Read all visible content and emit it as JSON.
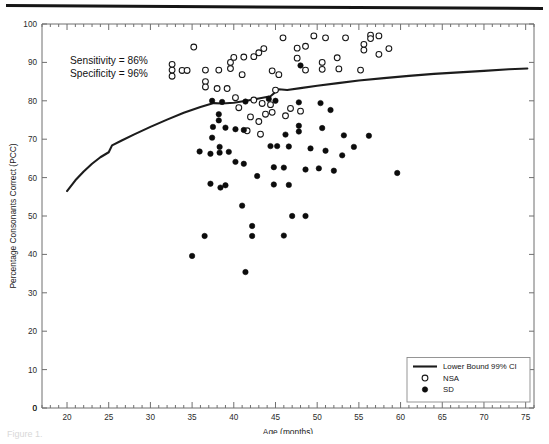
{
  "figure": {
    "caption_fragment": "Figure 1."
  },
  "annotations": [
    "Sensitivity = 86%",
    "Specificity = 96%"
  ],
  "legend": {
    "title": "",
    "items": [
      {
        "label": "Lower Bound 99% CI",
        "marker": "line"
      },
      {
        "label": "NSA",
        "marker": "open-circle"
      },
      {
        "label": "SD",
        "marker": "filled-circle"
      }
    ]
  },
  "chart_data": {
    "type": "scatter",
    "title": "",
    "xlabel": "Age (months)",
    "ylabel": "Percentage Consonants Correct (PCC)",
    "xlim": [
      17,
      76
    ],
    "ylim": [
      0,
      100
    ],
    "xticks": [
      20,
      25,
      30,
      35,
      40,
      45,
      50,
      55,
      60,
      65,
      70,
      75
    ],
    "xminor_step": 1,
    "yticks": [
      0,
      10,
      20,
      30,
      40,
      50,
      60,
      70,
      80,
      90,
      100
    ],
    "origin_label": "0",
    "grid": false,
    "legend_position": "lower-right",
    "series": [
      {
        "name": "Lower Bound 99% CI",
        "type": "line",
        "color": "#1c1c1c",
        "points": [
          [
            20.0,
            56.5
          ],
          [
            21.0,
            59.3
          ],
          [
            22.0,
            61.6
          ],
          [
            23.0,
            63.6
          ],
          [
            24.0,
            65.3
          ],
          [
            25.0,
            66.6
          ],
          [
            25.4,
            68.4
          ],
          [
            26.5,
            69.6
          ],
          [
            28.0,
            71.2
          ],
          [
            30.0,
            73.2
          ],
          [
            32.0,
            75.1
          ],
          [
            34.0,
            76.9
          ],
          [
            36.0,
            78.4
          ],
          [
            37.6,
            79.4
          ],
          [
            38.6,
            79.3
          ],
          [
            40.0,
            79.5
          ],
          [
            41.5,
            80.0
          ],
          [
            43.0,
            80.6
          ],
          [
            44.4,
            81.2
          ],
          [
            45.4,
            83.0
          ],
          [
            46.4,
            82.8
          ],
          [
            48.0,
            83.3
          ],
          [
            50.0,
            83.9
          ],
          [
            52.5,
            84.6
          ],
          [
            55.0,
            85.3
          ],
          [
            58.0,
            85.9
          ],
          [
            61.0,
            86.5
          ],
          [
            64.0,
            87.0
          ],
          [
            67.0,
            87.4
          ],
          [
            70.0,
            87.8
          ],
          [
            73.0,
            88.2
          ],
          [
            75.2,
            88.4
          ]
        ]
      },
      {
        "name": "NSA",
        "type": "scatter",
        "marker": "open-circle",
        "points": [
          [
            35.2,
            94.0
          ],
          [
            32.6,
            89.5
          ],
          [
            32.6,
            88.0
          ],
          [
            32.6,
            86.4
          ],
          [
            33.8,
            87.9
          ],
          [
            34.4,
            87.9
          ],
          [
            36.6,
            88.0
          ],
          [
            38.2,
            88.0
          ],
          [
            36.6,
            85.0
          ],
          [
            36.6,
            83.6
          ],
          [
            38.0,
            83.2
          ],
          [
            39.2,
            83.2
          ],
          [
            39.6,
            88.4
          ],
          [
            39.6,
            90.0
          ],
          [
            40.0,
            91.3
          ],
          [
            41.2,
            91.4
          ],
          [
            42.4,
            91.5
          ],
          [
            43.0,
            92.5
          ],
          [
            43.6,
            93.6
          ],
          [
            44.6,
            87.8
          ],
          [
            45.4,
            86.8
          ],
          [
            41.0,
            86.8
          ],
          [
            40.2,
            80.8
          ],
          [
            40.6,
            78.2
          ],
          [
            42.4,
            80.2
          ],
          [
            43.4,
            79.3
          ],
          [
            44.4,
            79.0
          ],
          [
            42.0,
            75.8
          ],
          [
            43.0,
            74.6
          ],
          [
            41.6,
            72.2
          ],
          [
            43.2,
            71.3
          ],
          [
            45.0,
            82.8
          ],
          [
            45.9,
            96.4
          ],
          [
            47.6,
            93.7
          ],
          [
            47.6,
            91.1
          ],
          [
            48.6,
            94.2
          ],
          [
            48.6,
            88.0
          ],
          [
            49.6,
            96.9
          ],
          [
            51.0,
            96.4
          ],
          [
            50.6,
            90.0
          ],
          [
            50.6,
            88.2
          ],
          [
            52.4,
            91.2
          ],
          [
            52.6,
            88.3
          ],
          [
            53.4,
            96.4
          ],
          [
            55.6,
            94.7
          ],
          [
            55.6,
            93.2
          ],
          [
            56.4,
            97.1
          ],
          [
            56.4,
            96.2
          ],
          [
            57.4,
            96.9
          ],
          [
            57.4,
            92.1
          ],
          [
            55.2,
            88.0
          ],
          [
            58.6,
            93.6
          ],
          [
            46.8,
            78.0
          ],
          [
            48.0,
            77.3
          ],
          [
            46.2,
            76.1
          ],
          [
            44.6,
            77.0
          ],
          [
            43.8,
            76.5
          ]
        ]
      },
      {
        "name": "SD",
        "type": "scatter",
        "marker": "filled-circle",
        "points": [
          [
            48.0,
            89.2
          ],
          [
            37.4,
            80.0
          ],
          [
            38.6,
            79.7
          ],
          [
            41.4,
            79.8
          ],
          [
            44.2,
            80.5
          ],
          [
            45.0,
            80.0
          ],
          [
            47.8,
            79.6
          ],
          [
            50.4,
            79.4
          ],
          [
            51.6,
            77.6
          ],
          [
            38.2,
            76.5
          ],
          [
            38.2,
            74.9
          ],
          [
            37.5,
            73.2
          ],
          [
            39.0,
            73.0
          ],
          [
            40.2,
            72.6
          ],
          [
            41.2,
            72.4
          ],
          [
            37.4,
            70.4
          ],
          [
            46.2,
            71.2
          ],
          [
            47.8,
            73.5
          ],
          [
            47.8,
            72.0
          ],
          [
            50.6,
            72.9
          ],
          [
            53.2,
            71.0
          ],
          [
            56.2,
            70.9
          ],
          [
            35.9,
            66.8
          ],
          [
            37.2,
            66.2
          ],
          [
            38.3,
            68.0
          ],
          [
            38.3,
            66.5
          ],
          [
            39.4,
            66.7
          ],
          [
            40.2,
            64.1
          ],
          [
            41.2,
            63.6
          ],
          [
            44.4,
            68.2
          ],
          [
            45.2,
            68.2
          ],
          [
            46.6,
            68.1
          ],
          [
            49.2,
            67.6
          ],
          [
            51.0,
            67.0
          ],
          [
            53.0,
            65.8
          ],
          [
            54.4,
            68.0
          ],
          [
            59.6,
            61.2
          ],
          [
            44.8,
            62.7
          ],
          [
            46.0,
            62.6
          ],
          [
            48.6,
            62.1
          ],
          [
            50.2,
            62.4
          ],
          [
            52.0,
            61.8
          ],
          [
            42.8,
            60.4
          ],
          [
            37.2,
            58.4
          ],
          [
            39.0,
            58.0
          ],
          [
            38.4,
            57.4
          ],
          [
            44.8,
            58.2
          ],
          [
            46.6,
            58.1
          ],
          [
            41.0,
            52.7
          ],
          [
            47.0,
            50.0
          ],
          [
            48.6,
            50.0
          ],
          [
            42.2,
            47.4
          ],
          [
            36.5,
            44.8
          ],
          [
            42.2,
            44.8
          ],
          [
            46.0,
            44.9
          ],
          [
            35.0,
            39.6
          ],
          [
            41.4,
            35.4
          ]
        ]
      }
    ]
  }
}
